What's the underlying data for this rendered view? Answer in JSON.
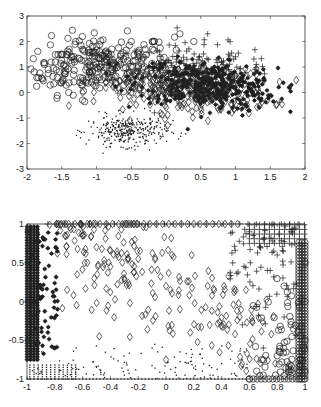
{
  "chart_data": [
    {
      "type": "scatter",
      "title": "",
      "xlabel": "",
      "ylabel": "",
      "xlim": [
        -2,
        2
      ],
      "ylim": [
        -3,
        3
      ],
      "xticks": [
        -2,
        -1.5,
        -1,
        -0.5,
        0,
        0.5,
        1,
        1.5,
        2
      ],
      "xtick_labels": [
        "-2",
        "-1.5",
        "-1",
        "-0.5",
        "0",
        "0.5",
        "1",
        "1.5",
        "2"
      ],
      "yticks": [
        -3,
        -2,
        -1,
        0,
        1,
        2,
        3
      ],
      "ytick_labels": [
        "-3",
        "-2",
        "-1",
        "0",
        "1",
        "2",
        "3"
      ],
      "grid": false,
      "legend": null,
      "series": [
        {
          "name": "circles",
          "marker": "o",
          "count": 260,
          "center": [
            -1.0,
            1.1
          ],
          "spread": [
            0.55,
            0.55
          ],
          "tilt": 0.1,
          "sample_points": [
            [
              -1.75,
              1.1
            ],
            [
              -1.5,
              1.5
            ],
            [
              -1.3,
              2.0
            ],
            [
              -1.0,
              1.8
            ],
            [
              -0.8,
              1.2
            ],
            [
              -0.5,
              2.0
            ],
            [
              -0.3,
              1.7
            ],
            [
              0.2,
              2.3
            ],
            [
              0.4,
              2.0
            ],
            [
              -1.2,
              0.3
            ],
            [
              -1.4,
              0.0
            ],
            [
              -1.2,
              -0.3
            ]
          ]
        },
        {
          "name": "plus",
          "marker": "+",
          "count": 140,
          "center": [
            0.4,
            0.9
          ],
          "spread": [
            0.55,
            0.5
          ],
          "tilt": 0.0,
          "sample_points": [
            [
              -0.3,
              1.4
            ],
            [
              0.0,
              1.2
            ],
            [
              0.3,
              1.3
            ],
            [
              0.9,
              1.5
            ],
            [
              0.6,
              2.3
            ],
            [
              1.3,
              1.1
            ],
            [
              1.0,
              1.4
            ],
            [
              0.2,
              0.5
            ]
          ]
        },
        {
          "name": "asterisks",
          "marker": "*",
          "count": 380,
          "center": [
            0.6,
            0.3
          ],
          "spread": [
            0.5,
            0.45
          ],
          "tilt": -0.25,
          "sample_points": [
            [
              0.0,
              0.5
            ],
            [
              0.5,
              0.3
            ],
            [
              1.0,
              0.2
            ],
            [
              1.5,
              -0.1
            ],
            [
              1.2,
              -0.7
            ],
            [
              1.3,
              0.5
            ],
            [
              0.8,
              -0.4
            ],
            [
              1.1,
              -0.9
            ]
          ]
        },
        {
          "name": "diamonds",
          "marker": "d",
          "count": 300,
          "center": [
            0.3,
            0.1
          ],
          "spread": [
            0.6,
            0.45
          ],
          "tilt": -0.1,
          "sample_points": [
            [
              -0.2,
              -0.1
            ],
            [
              0.0,
              -0.3
            ],
            [
              0.3,
              0.2
            ],
            [
              0.5,
              -0.6
            ],
            [
              1.3,
              0.7
            ],
            [
              -1.2,
              0.0
            ],
            [
              0.2,
              -0.5
            ],
            [
              0.8,
              0.3
            ]
          ]
        },
        {
          "name": "dots",
          "marker": ".",
          "count": 330,
          "center": [
            -0.55,
            -1.5
          ],
          "spread": [
            0.28,
            0.3
          ],
          "tilt": 0.0,
          "sample_points": [
            [
              -0.9,
              -1.0
            ],
            [
              -0.7,
              -1.6
            ],
            [
              -0.6,
              -1.9
            ],
            [
              -0.5,
              -1.5
            ],
            [
              -0.3,
              -1.9
            ],
            [
              -0.8,
              -2.0
            ],
            [
              0.1,
              -1.1
            ],
            [
              0.0,
              -1.5
            ]
          ]
        }
      ]
    },
    {
      "type": "scatter",
      "title": "",
      "xlabel": "",
      "ylabel": "",
      "xlim": [
        -1,
        1
      ],
      "ylim": [
        -1,
        1
      ],
      "xticks": [
        -1,
        -0.8,
        -0.6,
        -0.4,
        -0.2,
        0,
        0.2,
        0.4,
        0.6,
        0.8,
        1
      ],
      "xtick_labels": [
        "-1",
        "-0.8",
        "-0.6",
        "-0.4",
        "-0.2",
        "0",
        "0.2",
        "0.4",
        "0.6",
        "0.8",
        "1"
      ],
      "yticks": [
        -1,
        -0.5,
        0,
        0.5,
        1
      ],
      "ytick_labels": [
        "-1",
        "-0.5",
        "0",
        "0.5",
        "1"
      ],
      "grid": false,
      "legend": null,
      "series": [
        {
          "name": "asterisks",
          "marker": "*",
          "region": "left columns x in [-1,-0.8], saturated at x=-1",
          "sample_points": [
            [
              -1,
              0.9
            ],
            [
              -1,
              0.5
            ],
            [
              -1,
              0.0
            ],
            [
              -1,
              -0.5
            ],
            [
              -0.96,
              0.6
            ],
            [
              -0.92,
              0.2
            ],
            [
              -0.88,
              0.8
            ],
            [
              -0.85,
              -0.4
            ],
            [
              -0.8,
              0.0
            ],
            [
              -0.78,
              -0.1
            ]
          ]
        },
        {
          "name": "diamonds",
          "marker": "d",
          "region": "diagonal band from upper-left to middle",
          "sample_points": [
            [
              -0.6,
              0.85
            ],
            [
              -0.5,
              0.7
            ],
            [
              -0.4,
              0.45
            ],
            [
              -0.3,
              0.3
            ],
            [
              -0.2,
              0.55
            ],
            [
              0.0,
              0.2
            ],
            [
              0.1,
              -0.1
            ],
            [
              0.3,
              0.2
            ],
            [
              -0.48,
              -0.45
            ],
            [
              0.0,
              -0.75
            ]
          ]
        },
        {
          "name": "plus",
          "marker": "+",
          "region": "upper-right corner, saturated at y=1",
          "sample_points": [
            [
              0.6,
              0.9
            ],
            [
              0.7,
              0.8
            ],
            [
              0.8,
              0.6
            ],
            [
              0.9,
              0.9
            ],
            [
              0.75,
              0.4
            ],
            [
              0.55,
              -0.3
            ],
            [
              0.85,
              -0.2
            ],
            [
              0.7,
              -0.6
            ]
          ]
        },
        {
          "name": "circles",
          "marker": "o",
          "region": "lower-right, saturated at x=1 and y=-1",
          "sample_points": [
            [
              1,
              0.5
            ],
            [
              1,
              0.0
            ],
            [
              1,
              -0.5
            ],
            [
              1,
              -0.9
            ],
            [
              0.9,
              -0.3
            ],
            [
              0.8,
              -0.7
            ],
            [
              0.7,
              -0.95
            ],
            [
              0.6,
              -1
            ],
            [
              0.85,
              0.2
            ]
          ]
        },
        {
          "name": "dots",
          "marker": ".",
          "region": "bottom strip y in [-1,-0.5], saturated at y=-1",
          "sample_points": [
            [
              -0.9,
              -0.9
            ],
            [
              -0.7,
              -0.8
            ],
            [
              -0.5,
              -0.85
            ],
            [
              -0.3,
              -0.95
            ],
            [
              -0.1,
              -0.6
            ],
            [
              0.1,
              -0.65
            ],
            [
              0.4,
              -0.8
            ],
            [
              0.5,
              -0.95
            ]
          ]
        }
      ]
    }
  ]
}
